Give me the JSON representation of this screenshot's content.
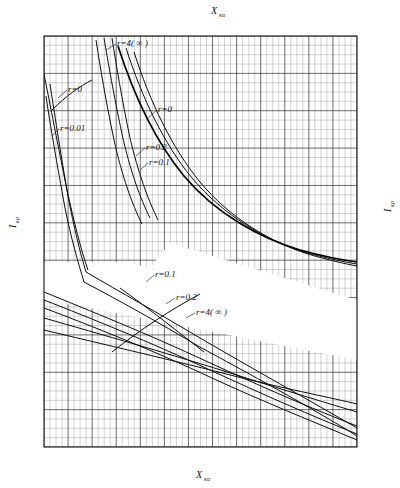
{
  "chart_data": {
    "type": "line",
    "title": "",
    "subtitle": "",
    "xlabel_bottom": "X",
    "xlabel_bottom_sub": "κα",
    "xlabel_top": "X",
    "xlabel_top_sub": "κα",
    "ylabel_left": "I",
    "ylabel_left_sub": "κρ",
    "ylabel_right": "I",
    "ylabel_right_sub": "κρ",
    "grid": true,
    "legend_position": "inline-annotations",
    "bottom_axis": {
      "label": "X",
      "sub": "κα",
      "ticks": [
        "0.18",
        "0.20",
        "0.25",
        "0.30",
        "0.35",
        "0.40",
        "0.45",
        "0.50",
        "0.55"
      ],
      "tick_values": [
        0.18,
        0.2,
        0.25,
        0.3,
        0.35,
        0.4,
        0.45,
        0.5,
        0.55
      ],
      "range": [
        0.18,
        0.57
      ]
    },
    "top_axis": {
      "label": "X",
      "sub": "κα",
      "ticks": [
        "0.5",
        "1.0",
        "1.5",
        "2.0",
        "2.5",
        "3.0",
        "3.5"
      ],
      "tick_values": [
        0.5,
        1.0,
        1.5,
        2.0,
        2.5,
        3.0,
        3.5
      ],
      "range": [
        0.22,
        3.62
      ]
    },
    "left_axis": {
      "label": "I",
      "sub": "κρ",
      "ticks": [
        "6.5",
        "6.0",
        "5.0",
        "4.0",
        "3.0",
        "2.0",
        "1.5"
      ],
      "tick_values": [
        6.5,
        6.0,
        5.0,
        4.0,
        3.0,
        2.0,
        1.5
      ],
      "range": [
        1.5,
        6.5
      ]
    },
    "right_axis": {
      "label": "I",
      "sub": "κρ",
      "ticks": [
        "2.0",
        "1.5",
        "1.0",
        "0.5",
        "0"
      ],
      "tick_values": [
        2.0,
        1.5,
        1.0,
        0.5,
        0.0
      ],
      "range": [
        0.0,
        2.0
      ]
    },
    "curve_labels": [
      {
        "id": "top-r4",
        "text": "r=4( ∞ )"
      },
      {
        "id": "upper-left-r0",
        "text": "r=0"
      },
      {
        "id": "upper-left-r001",
        "text": "r=0.01"
      },
      {
        "id": "upper-right-r0",
        "text": "r=0"
      },
      {
        "id": "upper-right-r02",
        "text": "r=0.2"
      },
      {
        "id": "upper-right-r01",
        "text": "r=0.1"
      },
      {
        "id": "lower-r01",
        "text": "r=0.1"
      },
      {
        "id": "lower-r02",
        "text": "r=0.2"
      },
      {
        "id": "lower-r4",
        "text": "r=4( ∞ )"
      }
    ],
    "series": [
      {
        "name": "r=0 (upper-left steep)",
        "parameter_r": 0
      },
      {
        "name": "r=0.01 (upper-left steep)",
        "parameter_r": 0.01
      },
      {
        "name": "r=4(∞) (top steep)",
        "parameter_r": "4(∞)"
      },
      {
        "name": "r=0 (upper main)",
        "parameter_r": 0
      },
      {
        "name": "r=0.1 (upper main)",
        "parameter_r": 0.1
      },
      {
        "name": "r=0.2 (upper main)",
        "parameter_r": 0.2
      },
      {
        "name": "r=0.1 (lower family)",
        "parameter_r": 0.1
      },
      {
        "name": "r=0.2 (lower family)",
        "parameter_r": 0.2
      },
      {
        "name": "r=4(∞) (lower family)",
        "parameter_r": "4(∞)"
      }
    ],
    "colors": {
      "grid_minor": "#8d8d8d",
      "grid_major": "#3b3b3b",
      "frame": "#111111",
      "curve": "#0d0d0d",
      "background": "#ffffff"
    }
  }
}
